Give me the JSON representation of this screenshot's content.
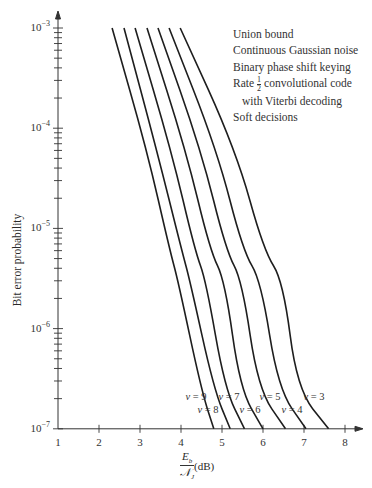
{
  "chart_data": {
    "type": "line",
    "title": "",
    "xlabel": "E_b / N_J (dB)",
    "xlabel_parts": {
      "num": "E_b",
      "den": "N_J",
      "unit": "(dB)"
    },
    "ylabel": "Bit error probability",
    "xlim": [
      1,
      8
    ],
    "ylim": [
      1e-07,
      0.001
    ],
    "yscale": "log",
    "grid": false,
    "x_ticks": [
      "1",
      "2",
      "3",
      "4",
      "5",
      "6",
      "7",
      "8"
    ],
    "y_ticks": [
      "10^-3",
      "10^-4",
      "10^-5",
      "10^-6",
      "10^-7"
    ],
    "legend_position": "none (inline curve labels)",
    "annotations": [
      "Union bound",
      "Continuous Gaussian noise",
      "Binary phase shift keying",
      "Rate 1/2 convolutional code",
      "with Viterbi decoding",
      "Soft decisions"
    ],
    "y_points": [
      0.001,
      6e-05,
      6e-06,
      3e-06,
      2.5e-07,
      1e-07
    ],
    "series": [
      {
        "name": "v = 9",
        "x": [
          2.32,
          3.17,
          3.73,
          3.93,
          4.49,
          4.8
        ]
      },
      {
        "name": "v = 8",
        "x": [
          2.61,
          3.41,
          4.02,
          4.22,
          4.8,
          5.2
        ]
      },
      {
        "name": "v = 7",
        "x": [
          2.88,
          3.76,
          4.34,
          4.61,
          5.07,
          5.55
        ]
      },
      {
        "name": "v = 6",
        "x": [
          3.17,
          4.12,
          4.71,
          5.07,
          5.44,
          6.0
        ]
      },
      {
        "name": "v = 5",
        "x": [
          3.44,
          4.49,
          5.1,
          5.49,
          5.88,
          6.55
        ]
      },
      {
        "name": "v = 4",
        "x": [
          3.71,
          4.88,
          5.51,
          5.95,
          6.37,
          7.05
        ]
      },
      {
        "name": "v = 3",
        "x": [
          3.98,
          5.34,
          6.02,
          6.49,
          6.83,
          7.6
        ]
      }
    ]
  },
  "legend_text": {
    "line1": "Union bound",
    "line2": "Continuous Gaussian noise",
    "line3": "Binary phase shift keying",
    "line4_pre": "Rate",
    "line4_frac_num": "1",
    "line4_frac_den": "2",
    "line4_post": "convolutional code",
    "line5": "with Viterbi decoding",
    "line6": "Soft decisions"
  },
  "axis_text": {
    "ylabel": "Bit error probability",
    "x_num": "E",
    "x_num_sub": "b",
    "x_den": "𝒩",
    "x_den_sub": "J",
    "x_unit": "(dB)"
  }
}
